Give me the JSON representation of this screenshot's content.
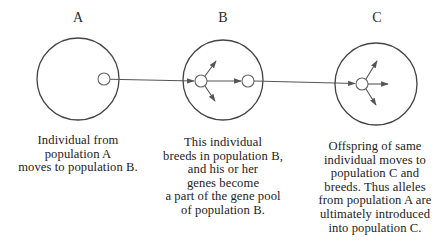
{
  "populations": [
    {
      "id": "A",
      "label": "A",
      "caption": "Individual from\npopulation A\nmoves to population B."
    },
    {
      "id": "B",
      "label": "B",
      "caption": "This individual\nbreeds in population B,\nand his or her\ngenes become\na part of the gene pool\nof population B."
    },
    {
      "id": "C",
      "label": "C",
      "caption": "Offspring of same\nindividual moves to\npopulation C and\nbreeds. Thus alleles\nfrom population A are\nultimately introduced\ninto population C."
    }
  ],
  "colors": {
    "stroke": "#444444",
    "background": "#ffffff",
    "text": "#222222"
  }
}
